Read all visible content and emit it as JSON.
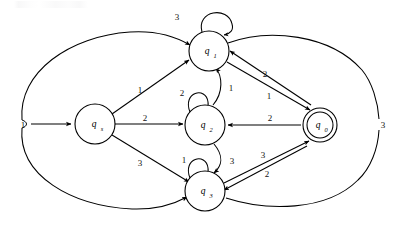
{
  "diagram": {
    "type": "state-machine",
    "stroke_color": "#000000",
    "background_color": "#ffffff",
    "states": [
      {
        "id": "qs",
        "label": "q",
        "subscript": "s",
        "role": "start",
        "accepting": false,
        "cx": 95,
        "cy": 124,
        "r": 20
      },
      {
        "id": "q1",
        "label": "q",
        "subscript": "1",
        "role": "normal",
        "accepting": false,
        "cx": 209,
        "cy": 51,
        "r": 20
      },
      {
        "id": "q2",
        "label": "q",
        "subscript": "2",
        "role": "normal",
        "accepting": false,
        "cx": 205,
        "cy": 125,
        "r": 20
      },
      {
        "id": "q3",
        "label": "q",
        "subscript": "3",
        "role": "normal",
        "accepting": false,
        "cx": 205,
        "cy": 191,
        "r": 20
      },
      {
        "id": "q0",
        "label": "q",
        "subscript": "0",
        "role": "accepting",
        "accepting": true,
        "cx": 320,
        "cy": 125,
        "r": 17
      }
    ],
    "start_arrow": {
      "label": "1",
      "from_x": 26,
      "to_x": 73,
      "y": 124
    },
    "transitions": [
      {
        "from": "start",
        "to": "qs",
        "label": "1",
        "kind": "straight"
      },
      {
        "from": "qs",
        "to": "q1",
        "label": "1",
        "kind": "straight"
      },
      {
        "from": "qs",
        "to": "q2",
        "label": "2",
        "kind": "straight"
      },
      {
        "from": "qs",
        "to": "q3",
        "label": "3",
        "kind": "straight"
      },
      {
        "from": "q1",
        "to": "q1",
        "label": "3",
        "kind": "self-loop"
      },
      {
        "from": "q2",
        "to": "q2",
        "label": "2",
        "kind": "self-loop"
      },
      {
        "from": "q3",
        "to": "q3",
        "label": "1",
        "kind": "self-loop"
      },
      {
        "from": "q2",
        "to": "q1",
        "label": "1",
        "kind": "curved"
      },
      {
        "from": "q2",
        "to": "q3",
        "label": "3",
        "kind": "curved"
      },
      {
        "from": "q1",
        "to": "q0",
        "label": "1",
        "kind": "straight"
      },
      {
        "from": "q0",
        "to": "q1",
        "label": "2",
        "kind": "straight"
      },
      {
        "from": "q0",
        "to": "q2",
        "label": "2",
        "kind": "straight"
      },
      {
        "from": "q3",
        "to": "q0",
        "label": "3",
        "kind": "straight"
      },
      {
        "from": "q0",
        "to": "q3",
        "label": "2",
        "kind": "straight"
      },
      {
        "from": "q0",
        "to": "q1",
        "label": "3",
        "kind": "outer-arc-top"
      },
      {
        "from": "q0",
        "to": "q3",
        "label": "3",
        "kind": "outer-arc-bottom"
      }
    ],
    "edge_labels": {
      "start": "1",
      "qs_q1": "1",
      "qs_q2": "2",
      "qs_q3": "3",
      "q1_self": "3",
      "q2_self": "2",
      "q3_self": "1",
      "q2_q1": "1",
      "q2_q3": "3",
      "q1_q0": "1",
      "q0_q1": "2",
      "q0_q2": "2",
      "q3_q0": "3",
      "q0_q3": "2",
      "outer_right": "3"
    }
  }
}
